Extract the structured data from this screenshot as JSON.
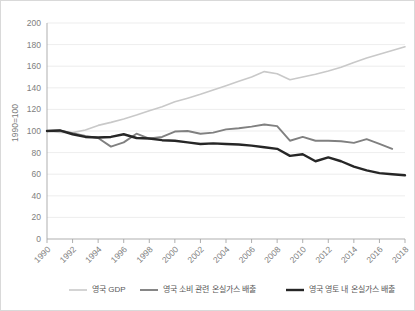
{
  "chart_data": {
    "type": "line",
    "title": "",
    "xlabel": "",
    "ylabel": "1990=100",
    "ylim": [
      0,
      200
    ],
    "ytick_step": 20,
    "yticks": [
      "0",
      "20",
      "40",
      "60",
      "80",
      "100",
      "120",
      "140",
      "160",
      "180",
      "200"
    ],
    "xlim": [
      1990,
      2018
    ],
    "xticks": [
      "1990",
      "1992",
      "1994",
      "1996",
      "1998",
      "2000",
      "2002",
      "2004",
      "2006",
      "2008",
      "2010",
      "2012",
      "2014",
      "2016",
      "2018"
    ],
    "x": [
      1990,
      1991,
      1992,
      1993,
      1994,
      1995,
      1996,
      1997,
      1998,
      1999,
      2000,
      2001,
      2002,
      2003,
      2004,
      2005,
      2006,
      2007,
      2008,
      2009,
      2010,
      2011,
      2012,
      2013,
      2014,
      2015,
      2016,
      2017,
      2018
    ],
    "grid": true,
    "legend_position": "bottom",
    "series": [
      {
        "name": "영국 GDP",
        "color": "#c9c9c9",
        "width": 1.6,
        "values": [
          100,
          98.7,
          98.5,
          101.0,
          105.2,
          108.0,
          111.2,
          114.8,
          118.8,
          122.5,
          127.0,
          130.4,
          134.0,
          138.0,
          142.0,
          146.0,
          150.0,
          155.0,
          153.0,
          147.5,
          150.0,
          152.5,
          155.5,
          159.0,
          163.5,
          167.5,
          171.0,
          174.5,
          178.0
        ]
      },
      {
        "name": "영국 소비 관련 온실가스 배출",
        "color": "#808080",
        "width": 1.9,
        "values": [
          100,
          100.5,
          98.0,
          95.5,
          93.5,
          85.5,
          89.5,
          97.5,
          93.0,
          94.5,
          99.5,
          100.0,
          97.5,
          98.5,
          101.5,
          102.5,
          104.0,
          106.0,
          104.5,
          91.0,
          94.5,
          91.0,
          91.0,
          90.5,
          89.0,
          92.5,
          88.0,
          83.5,
          null
        ]
      },
      {
        "name": "영국 영토 내 온실가스 배출",
        "color": "#262626",
        "width": 2.4,
        "values": [
          100,
          100.5,
          97.0,
          94.5,
          94.0,
          94.5,
          97.0,
          93.5,
          93.0,
          91.5,
          91.0,
          89.5,
          88.0,
          88.5,
          88.0,
          87.5,
          86.5,
          85.0,
          83.5,
          77.0,
          78.5,
          72.0,
          75.5,
          72.0,
          67.0,
          63.5,
          61.0,
          60.0,
          59.0
        ]
      }
    ]
  },
  "legend": {
    "items": [
      {
        "label": "영국 GDP"
      },
      {
        "label": "영국 소비 관련 온실가스 배출"
      },
      {
        "label": "영국 영토 내 온실가스 배출"
      }
    ]
  }
}
